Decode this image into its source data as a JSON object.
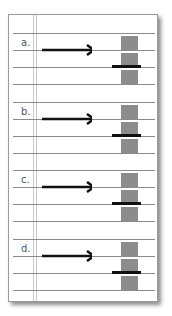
{
  "diagram": {
    "items": [
      {
        "label": "a."
      },
      {
        "label": "b."
      },
      {
        "label": "c."
      },
      {
        "label": "d."
      }
    ],
    "colors": {
      "box": "#8c8c8c",
      "arrow": "#111111",
      "rule": "#8a8a8a"
    }
  }
}
